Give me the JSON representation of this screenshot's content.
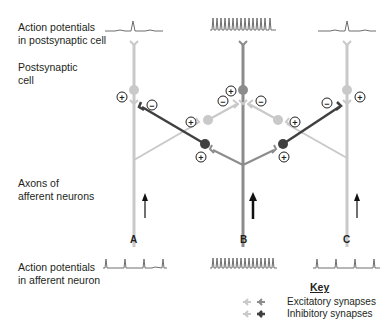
{
  "labels": {
    "ap_postsynaptic": "Action potentials\nin postsynaptic cell",
    "postsynaptic_cell": "Postsynaptic\ncell",
    "axons": "Axons of\nafferent neurons",
    "ap_afferent": "Action potentials\nin afferent neuron"
  },
  "columns": [
    {
      "id": "A",
      "label": "A"
    },
    {
      "id": "B",
      "label": "B"
    },
    {
      "id": "C",
      "label": "C"
    }
  ],
  "signs": {
    "plus": "+",
    "minus": "−"
  },
  "key": {
    "title": "Key",
    "excitatory": "Excitatory synapses",
    "inhibitory": "Inhibitory synapses"
  },
  "colors": {
    "light": "#c9c9c9",
    "medium": "#8c8c8c",
    "dark": "#404040",
    "trace": "#6e6e6e",
    "arrow": "#111111"
  }
}
